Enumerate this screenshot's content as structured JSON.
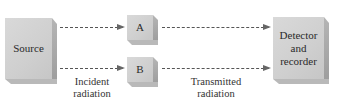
{
  "diagram": {
    "boxes": {
      "source": {
        "label": "Source"
      },
      "sample_a": {
        "label": "A"
      },
      "sample_b": {
        "label": "B"
      },
      "detector": {
        "line1": "Detector",
        "line2": "and",
        "line3": "recorder"
      }
    },
    "labels": {
      "incident_line1": "Incident",
      "incident_line2": "radiation",
      "transmitted_line1": "Transmitted",
      "transmitted_line2": "radiation"
    },
    "colors": {
      "box_face": "#d2d2d2",
      "box_side": "#a9a9a9",
      "arrow": "#555555"
    }
  }
}
